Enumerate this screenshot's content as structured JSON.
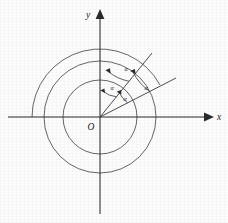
{
  "figure": {
    "background_color": "#fcfcfc",
    "ink_color": "#2a2a2a",
    "curve_color": "#4b4b4b"
  },
  "axes": {
    "x_label": "x",
    "y_label": "y",
    "origin_label": "O",
    "x_axis": {
      "start_x": 8,
      "end_x": 212,
      "y": 117,
      "arrow": "right"
    },
    "y_axis": {
      "x": 100,
      "start_y": 214,
      "end_y": 10,
      "arrow": "up"
    }
  },
  "curves": [
    {
      "name": "outer-arc",
      "center_x": 100,
      "center_y": 117,
      "radius": 68,
      "start_angle_deg": 180,
      "end_angle_deg": 28,
      "description": "large arc sweeping from negative x-axis counterclockwise"
    },
    {
      "name": "inner-circle",
      "center_x": 100,
      "center_y": 117,
      "radius": 37,
      "start_angle_deg": 0,
      "end_angle_deg": 360,
      "description": "small full circle centered at origin"
    },
    {
      "name": "mid-circle",
      "center_x": 100,
      "center_y": 117,
      "radius": 56,
      "start_angle_deg": 0,
      "end_angle_deg": 360,
      "description": "medium full circle centered at origin"
    }
  ],
  "rays": [
    {
      "name": "steep-ray",
      "origin_x": 100,
      "origin_y": 117,
      "end_x": 152,
      "end_y": 53,
      "angle_deg": 51,
      "description": "upper steeper terminal side"
    },
    {
      "name": "shallow-ray",
      "origin_x": 100,
      "origin_y": 117,
      "end_x": 176,
      "end_y": 78,
      "angle_deg": 27,
      "description": "lower shallower terminal side"
    }
  ],
  "angles": [
    {
      "name": "angle-alpha-top",
      "label": "α",
      "arc_radius": 46,
      "start_deg": 51,
      "end_deg": 80,
      "label_x": 126,
      "label_y": 70,
      "arrow_direction": "counterclockwise"
    },
    {
      "name": "angle-alpha-left",
      "label": "α",
      "arc_radius": 26,
      "start_deg": 51,
      "end_deg": 84,
      "label_x": 113,
      "label_y": 89,
      "arrow_direction": "counterclockwise"
    },
    {
      "name": "angle-alpha-lower",
      "label": "α",
      "arc_radius": 31,
      "start_deg": 27,
      "end_deg": 52,
      "label_x": 126,
      "label_y": 100,
      "arrow_direction": "counterclockwise"
    },
    {
      "name": "angle-alpha-right",
      "label": "α",
      "arc_radius": 56,
      "start_deg": 27,
      "end_deg": 54,
      "label_x": 147,
      "label_y": 89,
      "arrow_direction": "counterclockwise"
    }
  ]
}
